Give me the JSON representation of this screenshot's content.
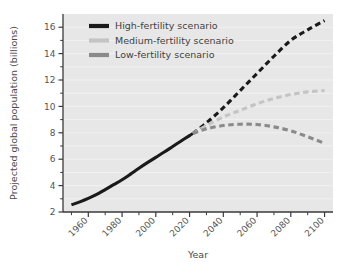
{
  "chart_data": {
    "type": "line",
    "title": "",
    "xlabel": "Year",
    "ylabel": "Projected global population (billions)",
    "xlim": [
      1945,
      2105
    ],
    "ylim": [
      2,
      17
    ],
    "grid": true,
    "legend_position": "top-left",
    "x_ticks_major": [
      1960,
      1980,
      2000,
      2020,
      2040,
      2060,
      2080,
      2100
    ],
    "x_tick_labels": [
      "1960",
      "1980",
      "2000",
      "2020",
      "2040",
      "2060",
      "2080",
      "2100"
    ],
    "x_ticks_minor": [
      1950,
      1970,
      1990,
      2010,
      2030,
      2050,
      2070,
      2090
    ],
    "y_ticks_major": [
      2,
      4,
      6,
      8,
      10,
      12,
      14,
      16
    ],
    "y_tick_labels": [
      "2",
      "4",
      "6",
      "8",
      "10",
      "12",
      "14",
      "16"
    ],
    "y_ticks_minor": [
      3,
      5,
      7,
      9,
      11,
      13,
      15
    ],
    "series": [
      {
        "name": "Historical",
        "style": "solid",
        "color": "#1a1a1a",
        "show_in_legend": false,
        "x": [
          1950,
          1955,
          1960,
          1965,
          1970,
          1975,
          1980,
          1985,
          1990,
          1995,
          2000,
          2005,
          2010,
          2015,
          2020,
          2022
        ],
        "values": [
          2.54,
          2.77,
          3.03,
          3.33,
          3.7,
          4.07,
          4.44,
          4.87,
          5.32,
          5.74,
          6.14,
          6.54,
          6.96,
          7.38,
          7.79,
          7.95
        ]
      },
      {
        "name": "High-fertility scenario",
        "style": "dashed",
        "color": "#1a1a1a",
        "show_in_legend": true,
        "x": [
          2022,
          2030,
          2040,
          2050,
          2060,
          2070,
          2080,
          2090,
          2100
        ],
        "values": [
          7.95,
          8.75,
          9.9,
          11.2,
          12.5,
          13.8,
          15.0,
          15.8,
          16.5
        ]
      },
      {
        "name": "Medium-fertility scenario",
        "style": "dashed",
        "color": "#c4c4c4",
        "show_in_legend": true,
        "x": [
          2022,
          2030,
          2040,
          2050,
          2060,
          2070,
          2080,
          2090,
          2100
        ],
        "values": [
          7.95,
          8.55,
          9.2,
          9.7,
          10.2,
          10.6,
          10.9,
          11.1,
          11.2
        ]
      },
      {
        "name": "Low-fertility scenario",
        "style": "dashed",
        "color": "#8a8a8a",
        "show_in_legend": true,
        "x": [
          2022,
          2030,
          2040,
          2050,
          2060,
          2070,
          2080,
          2090,
          2100
        ],
        "values": [
          7.95,
          8.3,
          8.55,
          8.65,
          8.63,
          8.45,
          8.15,
          7.7,
          7.2
        ]
      }
    ]
  },
  "legend": {
    "items": [
      {
        "label": "High-fertility scenario",
        "color": "#1a1a1a"
      },
      {
        "label": "Medium-fertility scenario",
        "color": "#c4c4c4"
      },
      {
        "label": "Low-fertility scenario",
        "color": "#8a8a8a"
      }
    ]
  },
  "colors": {
    "plot_background": "#e7e7e7",
    "gridline": "#f2f2f2",
    "axis": "#3a3a3a",
    "page_background": "#ffffff"
  }
}
